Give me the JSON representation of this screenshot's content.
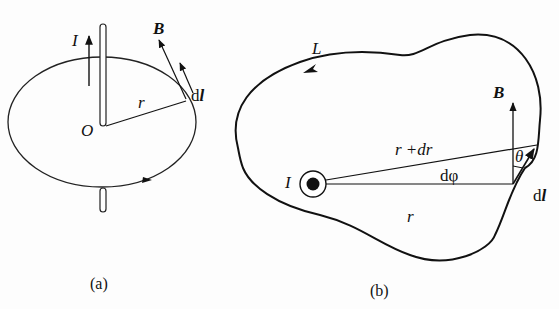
{
  "figure": {
    "panels": [
      {
        "id": "a",
        "caption": "(a)",
        "labels": {
          "current": "I",
          "field": "B",
          "radius": "r",
          "origin": "O",
          "line_element_d": "d",
          "line_element_l": "l"
        }
      },
      {
        "id": "b",
        "caption": "(b)",
        "labels": {
          "loop": "L",
          "field": "B",
          "radius_plus": "r +dr",
          "angle_theta": "θ",
          "angle_dphi": "dφ",
          "current": "I",
          "radius": "r",
          "line_element_d": "d",
          "line_element_l": "l"
        }
      }
    ],
    "colors": {
      "ink": "#111111",
      "background": "#fdfdfd"
    }
  }
}
